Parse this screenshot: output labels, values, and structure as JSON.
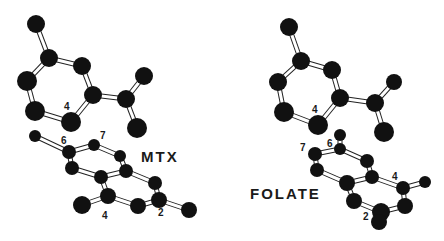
{
  "figure": {
    "background": "#ffffff",
    "atom_color": "#111111",
    "bond_color": "#ffffff",
    "bond_outline": "#222222"
  },
  "molecules": [
    {
      "name": "MTX",
      "name_pos": [
        141,
        149
      ],
      "atoms": [
        [
          36,
          24,
          9
        ],
        [
          49,
          58,
          9
        ],
        [
          82,
          66,
          9
        ],
        [
          27,
          81,
          10
        ],
        [
          93,
          95,
          9
        ],
        [
          126,
          99,
          9
        ],
        [
          144,
          76,
          9
        ],
        [
          35,
          111,
          10
        ],
        [
          71,
          122,
          10
        ],
        [
          137,
          128,
          10
        ],
        [
          35,
          136,
          6
        ],
        [
          69,
          152,
          7
        ],
        [
          94,
          145,
          6
        ],
        [
          120,
          156,
          6
        ],
        [
          72,
          168,
          7
        ],
        [
          101,
          177,
          7
        ],
        [
          126,
          171,
          7
        ],
        [
          155,
          183,
          7
        ],
        [
          108,
          196,
          8
        ],
        [
          82,
          205,
          9
        ],
        [
          138,
          206,
          8
        ],
        [
          159,
          200,
          8
        ],
        [
          189,
          210,
          8
        ]
      ],
      "bonds": [
        [
          0,
          1
        ],
        [
          1,
          2
        ],
        [
          1,
          3
        ],
        [
          2,
          4
        ],
        [
          3,
          7
        ],
        [
          4,
          5
        ],
        [
          5,
          6
        ],
        [
          5,
          9
        ],
        [
          4,
          8
        ],
        [
          7,
          8
        ],
        [
          10,
          11
        ],
        [
          11,
          12
        ],
        [
          12,
          13
        ],
        [
          11,
          14
        ],
        [
          14,
          15
        ],
        [
          15,
          16
        ],
        [
          13,
          16
        ],
        [
          16,
          17
        ],
        [
          15,
          18
        ],
        [
          18,
          19
        ],
        [
          18,
          20
        ],
        [
          20,
          21
        ],
        [
          17,
          21
        ],
        [
          21,
          22
        ]
      ],
      "labels": [
        {
          "text": "4",
          "x": 64,
          "y": 102
        },
        {
          "text": "6",
          "x": 61,
          "y": 136
        },
        {
          "text": "7",
          "x": 100,
          "y": 131
        },
        {
          "text": "4",
          "x": 102,
          "y": 211
        },
        {
          "text": "2",
          "x": 158,
          "y": 208
        }
      ]
    },
    {
      "name": "FOLATE",
      "name_pos": [
        250,
        186
      ],
      "atoms": [
        [
          289,
          27,
          9
        ],
        [
          301,
          61,
          9
        ],
        [
          332,
          70,
          9
        ],
        [
          278,
          82,
          9
        ],
        [
          340,
          98,
          9
        ],
        [
          375,
          103,
          9
        ],
        [
          394,
          82,
          8
        ],
        [
          284,
          112,
          10
        ],
        [
          318,
          125,
          10
        ],
        [
          384,
          132,
          10
        ],
        [
          340,
          135,
          6
        ],
        [
          340,
          149,
          6
        ],
        [
          315,
          154,
          7
        ],
        [
          367,
          161,
          7
        ],
        [
          317,
          170,
          7
        ],
        [
          372,
          177,
          7
        ],
        [
          347,
          183,
          8
        ],
        [
          403,
          188,
          7
        ],
        [
          425,
          182,
          6
        ],
        [
          354,
          201,
          8
        ],
        [
          405,
          206,
          8
        ],
        [
          381,
          212,
          9
        ],
        [
          379,
          222,
          8
        ]
      ],
      "bonds": [
        [
          0,
          1
        ],
        [
          1,
          2
        ],
        [
          1,
          3
        ],
        [
          2,
          4
        ],
        [
          3,
          7
        ],
        [
          4,
          5
        ],
        [
          5,
          6
        ],
        [
          5,
          9
        ],
        [
          4,
          8
        ],
        [
          7,
          8
        ],
        [
          10,
          11
        ],
        [
          11,
          12
        ],
        [
          11,
          13
        ],
        [
          12,
          14
        ],
        [
          14,
          16
        ],
        [
          13,
          15
        ],
        [
          15,
          16
        ],
        [
          15,
          17
        ],
        [
          17,
          18
        ],
        [
          17,
          20
        ],
        [
          16,
          19
        ],
        [
          19,
          21
        ],
        [
          20,
          21
        ],
        [
          21,
          22
        ]
      ],
      "labels": [
        {
          "text": "4",
          "x": 312,
          "y": 105
        },
        {
          "text": "6",
          "x": 327,
          "y": 139
        },
        {
          "text": "7",
          "x": 300,
          "y": 143
        },
        {
          "text": "4",
          "x": 392,
          "y": 172
        },
        {
          "text": "2",
          "x": 363,
          "y": 212
        }
      ]
    }
  ]
}
